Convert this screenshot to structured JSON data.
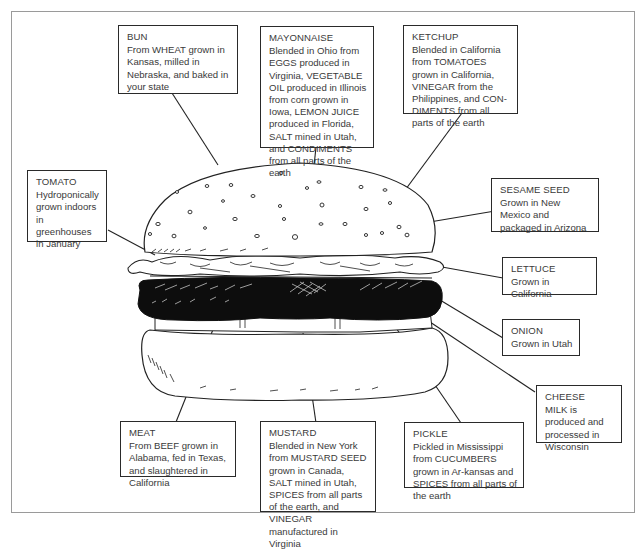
{
  "diagram": {
    "labels": [
      {
        "id": "bun",
        "title": "BUN",
        "text": "From WHEAT grown in Kansas, milled in Nebraska, and baked in your state"
      },
      {
        "id": "mayonnaise",
        "title": "MAYONNAISE",
        "text": "Blended in Ohio from EGGS produced in Virginia, VEGETABLE OIL produced in Illinois from corn grown in Iowa, LEMON JUICE produced in Florida, SALT mined in Utah, and CONDIMENTS from all parts of the earth"
      },
      {
        "id": "ketchup",
        "title": "KETCHUP",
        "text": "Blended in California from TOMATOES grown in California, VINEGAR from the Philippines, and CON-DIMENTS from all parts of the earth"
      },
      {
        "id": "tomato",
        "title": "TOMATO",
        "text": "Hydroponically grown indoors in greenhouses in January"
      },
      {
        "id": "sesame-seed",
        "title": "SESAME SEED",
        "text": "Grown in New Mexico and packaged in Arizona"
      },
      {
        "id": "lettuce",
        "title": "LETTUCE",
        "text": "Grown in California"
      },
      {
        "id": "onion",
        "title": "ONION",
        "text": "Grown in Utah"
      },
      {
        "id": "cheese",
        "title": "CHEESE",
        "text": "MILK is produced and processed in Wisconsin"
      },
      {
        "id": "meat",
        "title": "MEAT",
        "text": "From BEEF grown in Alabama, fed in Texas, and slaughtered in California"
      },
      {
        "id": "mustard",
        "title": "MUSTARD",
        "text": "Blended in New York from MUSTARD SEED grown in Canada, SALT mined in Utah, SPICES from all parts of the earth, and VINEGAR manufactured in Virginia"
      },
      {
        "id": "pickle",
        "title": "PICKLE",
        "text": "Pickled in Mississippi from CUCUMBERS grown in Ar-kansas and SPICES from all parts of the earth"
      }
    ]
  }
}
